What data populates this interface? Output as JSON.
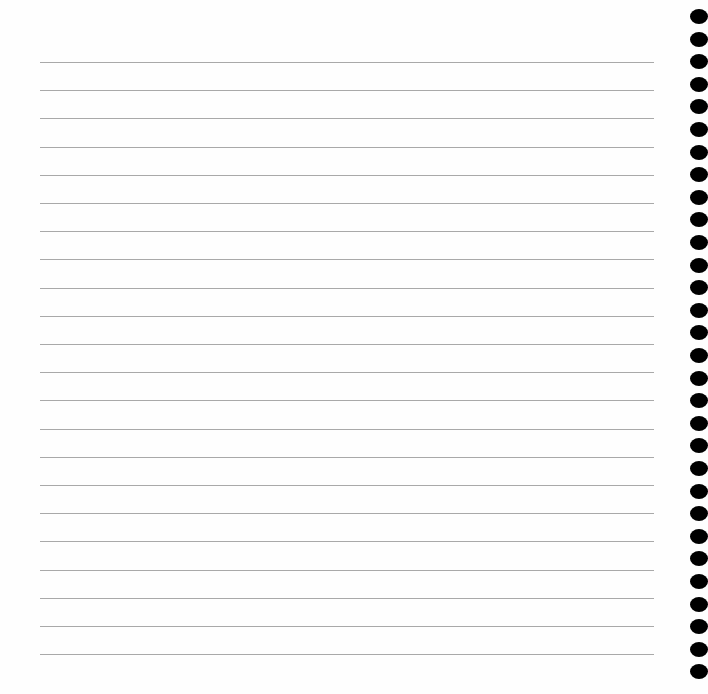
{
  "page": {
    "type": "lined-notebook-page",
    "line_count": 22,
    "line_start_y": 62,
    "line_spacing": 28.2,
    "line_color": "#a9a9a9",
    "binding": {
      "side": "right",
      "hole_count": 30,
      "hole_start_y": 9,
      "hole_spacing": 22.6,
      "hole_color": "#000000"
    }
  }
}
